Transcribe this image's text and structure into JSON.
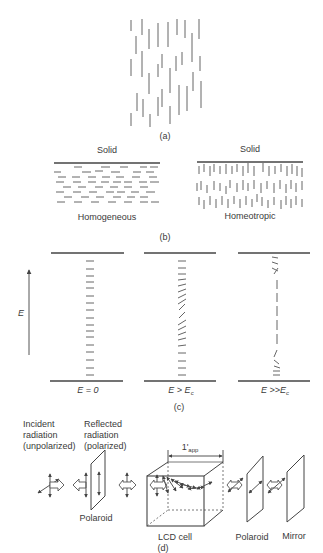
{
  "figure": {
    "panel_a": {
      "caption": "(a)"
    },
    "panel_b": {
      "caption": "(b)",
      "left": {
        "top_label": "Solid",
        "bottom_label": "Homogeneous"
      },
      "right": {
        "top_label": "Solid",
        "bottom_label": "Homeotropic"
      }
    },
    "panel_c": {
      "caption": "(c)",
      "axis_label": "E",
      "cells": [
        {
          "label_main": "E = 0",
          "label_sub": ""
        },
        {
          "label_main": "E > E",
          "label_sub": "c"
        },
        {
          "label_main": "E >>E",
          "label_sub": "c"
        }
      ]
    },
    "panel_d": {
      "caption": "(d)",
      "incident_label": [
        "Incident",
        "radiation",
        "(unpolarized)"
      ],
      "reflected_label": [
        "Reflected",
        "radiation",
        "(polarized)"
      ],
      "dimension_label_main": "1'",
      "dimension_label_sub": "app",
      "polaroid1_label": "Polaroid",
      "lcd_label": "LCD cell",
      "polaroid2_label": "Polaroid",
      "mirror_label": "Mirror"
    }
  }
}
